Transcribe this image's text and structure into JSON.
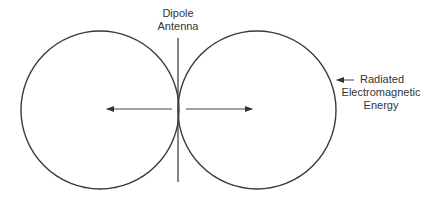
{
  "diagram": {
    "labels": {
      "antenna_line1": "Dipole",
      "antenna_line2": "Antenna",
      "energy_line1": "Radiated",
      "energy_line2": "Electromagnetic",
      "energy_line3": "Energy"
    },
    "elements": {
      "left_lobe": {
        "shape": "circle",
        "cx": 100,
        "cy": 110,
        "r": 79
      },
      "right_lobe": {
        "shape": "circle",
        "cx": 257,
        "cy": 110,
        "r": 79
      },
      "antenna": {
        "shape": "line",
        "x1": 178,
        "y1": 38,
        "x2": 178,
        "y2": 182
      },
      "left_arrow": {
        "shape": "arrow",
        "from": [
          172,
          109
        ],
        "to": [
          107,
          109
        ]
      },
      "right_arrow": {
        "shape": "arrow",
        "from": [
          186,
          109
        ],
        "to": [
          252,
          109
        ]
      },
      "label_arrow": {
        "shape": "arrow",
        "from": [
          354,
          80
        ],
        "to": [
          337,
          80
        ]
      }
    },
    "colors": {
      "stroke": "#333333",
      "text": "#333333",
      "background": "#ffffff"
    }
  }
}
